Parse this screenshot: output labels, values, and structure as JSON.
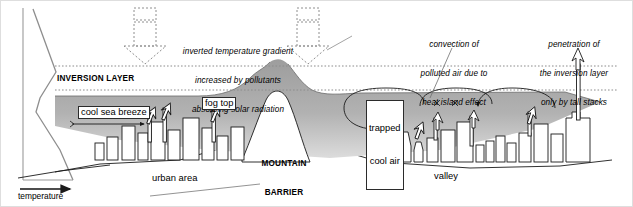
{
  "diagram": {
    "colors": {
      "fog_fill": "#a8a8a8",
      "fog_fill_light": "#c9c9c9",
      "line": "#1a1a1a",
      "dotted": "#8c8c8c",
      "frame": "#d8d8d8",
      "background": "#ffffff"
    },
    "axis": {
      "label": "temperature",
      "arrow_direction": "right",
      "orientation": "vertical-profile"
    },
    "layers": {
      "inversion_layer_label": "INVERSION LAYER",
      "fog_top_label": "fog top"
    },
    "annotations": [
      {
        "name": "solar-radiation-left",
        "lines": [
          "inverted temperature gradient",
          "increased by pollutants",
          "absorbing solar radiation"
        ]
      },
      {
        "name": "convection-heat-island",
        "lines": [
          "convection of",
          "polluted air due to",
          "heat island effect"
        ]
      },
      {
        "name": "tall-stack-penetration",
        "lines": [
          "penetration of",
          "the inversion layer",
          "only by tall stacks"
        ]
      }
    ],
    "features": [
      {
        "name": "cool-sea-breeze",
        "label": "cool sea breeze",
        "style": "boxed"
      },
      {
        "name": "fog-top",
        "label": "fog top",
        "style": "boxed"
      },
      {
        "name": "urban-area",
        "label": "urban area",
        "style": "plain"
      },
      {
        "name": "mountain-barrier",
        "label": "MOUNTAIN\nBARRIER",
        "style": "bold-caps"
      },
      {
        "name": "trapped-cool-air",
        "label": "trapped\ncool air",
        "style": "boxed"
      },
      {
        "name": "valley",
        "label": "valley",
        "style": "plain"
      }
    ],
    "labels": {
      "cool_sea_breeze": "cool sea breeze",
      "fog_top": "fog top",
      "urban_area": "urban area",
      "mountain_barrier_line1": "MOUNTAIN",
      "mountain_barrier_line2": "BARRIER",
      "trapped_line1": "trapped",
      "trapped_line2": "cool air",
      "valley": "valley",
      "inversion_layer": "INVERSION LAYER",
      "temperature": "temperature",
      "anno1_l1": "inverted temperature gradient",
      "anno1_l2": "increased by pollutants",
      "anno1_l3": "absorbing solar radiation",
      "anno2_l1": "convection of",
      "anno2_l2": "polluted air due to",
      "anno2_l3": "heat island effect",
      "anno3_l1": "penetration of",
      "anno3_l2": "the inversion layer",
      "anno3_l3": "only by tall stacks"
    }
  }
}
